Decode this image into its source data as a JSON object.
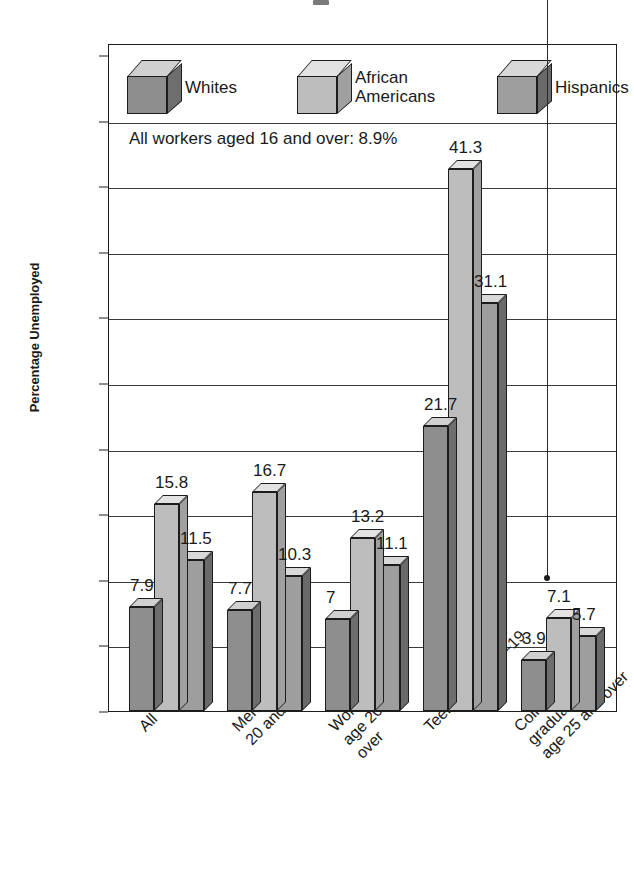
{
  "chart_data": {
    "type": "bar",
    "title": "",
    "xlabel": "",
    "ylabel": "Percentage Unemployed",
    "ylim": [
      0,
      50
    ],
    "ytick_step": 5,
    "yticks": [
      "50",
      "45",
      "40",
      "35",
      "30",
      "25",
      "20",
      "15",
      "10",
      "5",
      "0"
    ],
    "grid": "horizontal",
    "legend_position": "inside-top",
    "orientation": "vertical-grouped-3d",
    "categories": [
      "All",
      "Men, age\n20 and over",
      "Women,\nage 20 and\nover",
      "Teens, ages 16–19",
      "College graduates,\nage 25 and over"
    ],
    "series": [
      {
        "name": "Whites",
        "color": "#8e8e8e",
        "values": [
          7.9,
          7.7,
          7.0,
          21.7,
          3.9
        ]
      },
      {
        "name": "African\nAmericans",
        "color": "#bdbdbd",
        "values": [
          15.8,
          16.7,
          13.2,
          41.3,
          7.1
        ]
      },
      {
        "name": "Hispanics",
        "color": "#9e9e9e",
        "values": [
          11.5,
          10.3,
          11.1,
          31.1,
          5.7
        ]
      }
    ],
    "annotations": [
      {
        "text": "All workers aged 16 and over: 8.9%",
        "value": 8.9,
        "pointer": true
      }
    ]
  },
  "legend": {
    "items": [
      {
        "label": "Whites",
        "icon": "cube-icon"
      },
      {
        "label": "African\nAmericans",
        "icon": "cube-icon"
      },
      {
        "label": "Hispanics",
        "icon": "cube-icon"
      }
    ]
  },
  "axis": {
    "y_title": "Percentage Unemployed"
  },
  "colors": {
    "bar_whites_front": "#8e8e8e",
    "bar_whites_top": "#d0d0d0",
    "bar_whites_side": "#6e6e6e",
    "bar_african_front": "#bdbdbd",
    "bar_african_top": "#e2e2e2",
    "bar_african_side": "#a0a0a0",
    "bar_hispanic_front": "#9e9e9e",
    "bar_hispanic_side": "#6a6a6a",
    "bar_hispanic_top": "#d8d8d8",
    "frame": "#1c1c1c",
    "gridline": "#3a3a3a",
    "text": "#1a1a1a"
  }
}
